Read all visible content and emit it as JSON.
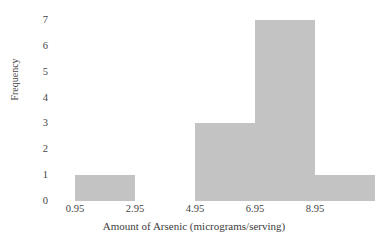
{
  "chart_data": {
    "type": "bar",
    "title": "",
    "xlabel": "Amount of Arsenic (micrograms/serving)",
    "ylabel": "Frequency",
    "categories": [
      "0.95",
      "2.95",
      "4.95",
      "6.95",
      "8.95"
    ],
    "x_tick_labels": [
      "0.95",
      "2.95",
      "4.95",
      "6.95",
      "8.95"
    ],
    "x_tick_values": [
      0.95,
      2.95,
      4.95,
      6.95,
      8.95
    ],
    "y_tick_labels": [
      "0",
      "1",
      "2",
      "3",
      "4",
      "5",
      "6",
      "7"
    ],
    "y_tick_values": [
      0,
      1,
      2,
      3,
      4,
      5,
      6,
      7
    ],
    "xlim": [
      0.45,
      10.45
    ],
    "ylim": [
      0,
      7
    ],
    "grid": false,
    "legend": null,
    "bin_width": 2,
    "bins": [
      {
        "label": "0.95-2.95",
        "left": 0.95,
        "right": 2.95,
        "value": 1
      },
      {
        "label": "2.95-4.95",
        "left": 2.95,
        "right": 4.95,
        "value": 0
      },
      {
        "label": "4.95-6.95",
        "left": 4.95,
        "right": 6.95,
        "value": 3
      },
      {
        "label": "6.95-8.95",
        "left": 6.95,
        "right": 8.95,
        "value": 7
      },
      {
        "label": "8.95-10.95",
        "left": 8.95,
        "right": 10.95,
        "value": 1
      }
    ],
    "values": [
      1,
      0,
      3,
      7,
      1
    ],
    "bar_color": "#c3c3c3",
    "background_color": "#ffffff",
    "text_color": "#444444"
  }
}
